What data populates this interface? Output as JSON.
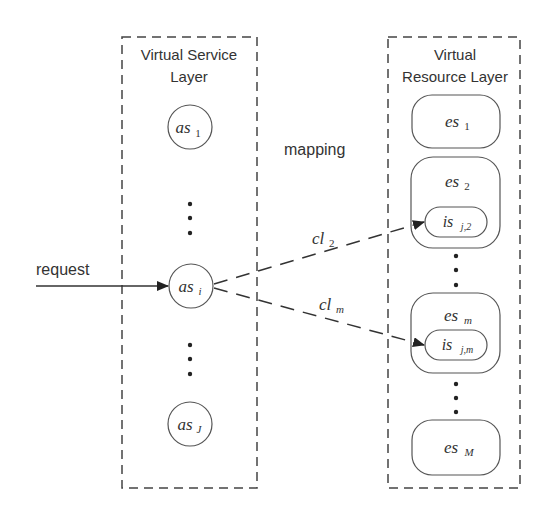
{
  "diagram": {
    "service_layer": {
      "title_line1": "Virtual Service",
      "title_line2": "Layer",
      "nodes": [
        {
          "base": "as",
          "sub": "1"
        },
        {
          "base": "as",
          "sub": "i"
        },
        {
          "base": "as",
          "sub": "J"
        }
      ]
    },
    "resource_layer": {
      "title_line1": "Virtual",
      "title_line2": "Resource Layer",
      "edge_servers": [
        {
          "base": "es",
          "sub": "1"
        },
        {
          "base": "es",
          "sub": "2",
          "inner": {
            "base": "is",
            "sub": "j,2"
          }
        },
        {
          "base": "es",
          "sub": "m",
          "inner": {
            "base": "is",
            "sub": "j,m"
          }
        },
        {
          "base": "es",
          "sub": "M"
        }
      ]
    },
    "mapping_label": "mapping",
    "request_label": "request",
    "links": [
      {
        "base": "cl",
        "sub": "2"
      },
      {
        "base": "cl",
        "sub": "m"
      }
    ],
    "colors": {
      "stroke": "#444444",
      "text": "#333333",
      "background": "#ffffff"
    }
  }
}
